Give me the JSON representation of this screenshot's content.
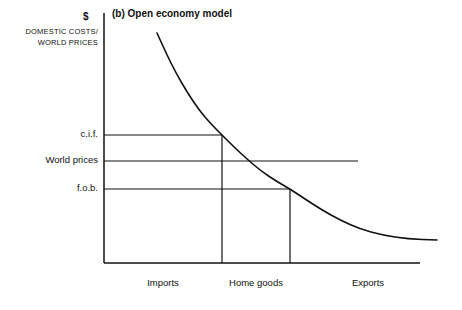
{
  "figure": {
    "panel_title": "(b) Open economy model",
    "currency_symbol": "$",
    "y_axis_title_line1": "Domestic costs/",
    "y_axis_title_line2": "world prices",
    "ink_color": "#111111",
    "background_color": "#ffffff"
  },
  "price_levels": [
    {
      "label": "c.i.f.",
      "y": 135
    },
    {
      "label": "World prices",
      "y": 161
    },
    {
      "label": "f.o.b.",
      "y": 189
    }
  ],
  "regions": [
    {
      "label": "Imports",
      "center_x": 163
    },
    {
      "label": "Home goods",
      "center_x": 256
    },
    {
      "label": "Exports",
      "center_x": 368
    }
  ],
  "chart_data": {
    "type": "line",
    "title": "(b) Open economy model",
    "xlabel": "",
    "ylabel": "Domestic costs/world prices",
    "grid": false,
    "legend": "none",
    "axes": {
      "x_axis_y": 263,
      "y_axis_x": 104,
      "x_axis_x_start": 104,
      "x_axis_x_end": 420,
      "y_axis_y_top": 13,
      "y_axis_y_bottom": 263
    },
    "series": [
      {
        "name": "Domestic resource cost curve",
        "points": [
          [
            157,
            33
          ],
          [
            166,
            53
          ],
          [
            176,
            73
          ],
          [
            187,
            92
          ],
          [
            199,
            110
          ],
          [
            211,
            124
          ],
          [
            222,
            135
          ],
          [
            234,
            147
          ],
          [
            247,
            159
          ],
          [
            261,
            171
          ],
          [
            276,
            181
          ],
          [
            290,
            189
          ],
          [
            305,
            199
          ],
          [
            322,
            210
          ],
          [
            340,
            220
          ],
          [
            360,
            229
          ],
          [
            382,
            235
          ],
          [
            408,
            239
          ],
          [
            437,
            240
          ]
        ]
      }
    ],
    "price_lines": [
      {
        "name": "c.i.f.",
        "y": 135,
        "x_start": 104,
        "x_end": 222
      },
      {
        "name": "World prices",
        "y": 161,
        "x_start": 104,
        "x_end": 358
      },
      {
        "name": "f.o.b.",
        "y": 189,
        "x_start": 104,
        "x_end": 290
      }
    ],
    "boundaries": [
      {
        "name": "imports-home-goods",
        "x": 222,
        "y_top": 135,
        "y_bottom": 263
      },
      {
        "name": "home-goods-exports",
        "x": 290,
        "y_top": 189,
        "y_bottom": 263
      }
    ],
    "intersections": [
      {
        "name": "cif-curve",
        "x": 222,
        "y": 135
      },
      {
        "name": "fob-curve",
        "x": 290,
        "y": 189
      }
    ],
    "annotations": [
      "Imports region lies left of x=222",
      "Home goods region between x=222 and x=290",
      "Exports region right of x=290"
    ]
  }
}
